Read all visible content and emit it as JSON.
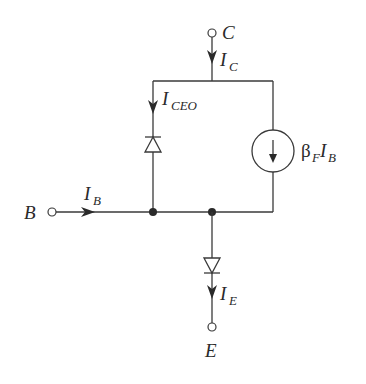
{
  "diagram": {
    "type": "BJT large-signal equivalent circuit (forward-active, with leakage)",
    "terminals": {
      "collector": {
        "label": "C"
      },
      "base": {
        "label": "B"
      },
      "emitter": {
        "label": "E"
      }
    },
    "currents": {
      "collector": {
        "main": "I",
        "sub": "C"
      },
      "leakage": {
        "main": "I",
        "sub": "CEO"
      },
      "base": {
        "main": "I",
        "sub": "B"
      },
      "emitter": {
        "main": "I",
        "sub": "E"
      }
    },
    "current_source": {
      "label_beta": "β",
      "label_beta_sub": "F",
      "label_i": "I",
      "label_i_sub": "B"
    },
    "components": [
      {
        "type": "diode",
        "branch": "I_CEO",
        "orientation": "anode-bottom, cathode-top"
      },
      {
        "type": "dependent-current-source",
        "value": "βF·IB",
        "direction": "down"
      },
      {
        "type": "diode",
        "branch": "emitter",
        "orientation": "anode-top, cathode-bottom"
      }
    ],
    "colors": {
      "ink": "#2a2a2a",
      "background": "#ffffff"
    }
  }
}
